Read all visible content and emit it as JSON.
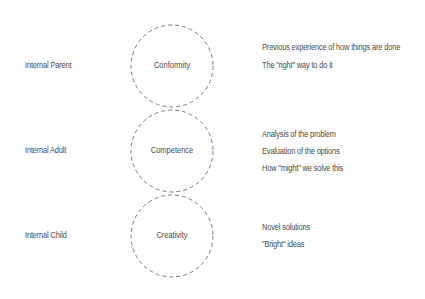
{
  "diagram": {
    "rows": [
      {
        "left_label": "Internal Parent",
        "circle_label": "Conformity",
        "notes": [
          "Previous experience of how things are done",
          "The \"right\" way to do it"
        ]
      },
      {
        "left_label": "Internal Adult",
        "circle_label": "Competence",
        "notes": [
          "Analysis of the problem",
          "Evaluation of the options",
          "How \"might\" we solve this"
        ]
      },
      {
        "left_label": "Internal Child",
        "circle_label": "Creativity",
        "notes": [
          "Novel solutions",
          "\"Bright\" ideas"
        ]
      }
    ],
    "colors": {
      "text": "#4a4a4a",
      "circle_stroke": "#5a5a5a",
      "background": "#ffffff"
    }
  }
}
